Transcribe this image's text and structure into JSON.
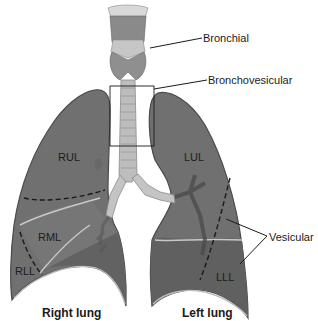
{
  "callouts": {
    "bronchial": "Bronchial",
    "bronchovesicular": "Bronchovesicular",
    "vesicular": "Vesicular"
  },
  "lobes": {
    "rul": "RUL",
    "rml": "RML",
    "rll": "RLL",
    "lul": "LUL",
    "lll": "LLL"
  },
  "captions": {
    "right_lung": "Right lung",
    "left_lung": "Left lung"
  },
  "colors": {
    "lung_fill": "#6f6f6f",
    "lung_lower_fill": "#5e5e5e",
    "lung_outline": "#4a4a4a",
    "fissure": "#c8c8c8",
    "trachea": "#bdbdbd",
    "larynx": "#8a8a8a",
    "dashed_line": "#1a1a1a",
    "leader_line": "#1a1a1a"
  }
}
